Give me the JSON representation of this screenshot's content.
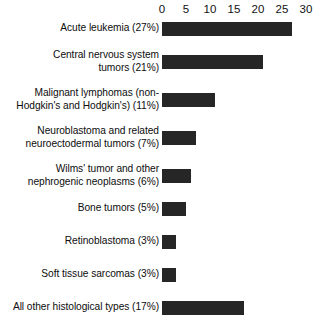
{
  "chart_data": {
    "type": "bar",
    "orientation": "horizontal",
    "title": "",
    "subtitle": "",
    "xlabel": "",
    "ylabel": "",
    "xlim": [
      0,
      30
    ],
    "grid": false,
    "legend": false,
    "bar_color": "#262626",
    "background_color": "#ffffff",
    "axis_position": "top",
    "tick_labels": [
      "0",
      "5",
      "10",
      "15",
      "20",
      "25",
      "30"
    ],
    "ticks": [
      0,
      5,
      10,
      15,
      20,
      25,
      30
    ],
    "categories": [
      "Acute leukemia (27%)",
      "Central nervous system\ntumors (21%)",
      "Malignant lymphomas (non-\nHodgkin's and Hodgkin's) (11%)",
      "Neuroblastoma and related\nneuroectodermal tumors (7%)",
      "Wilms' tumor and other\nnephrogenic neoplasms (6%)",
      "Bone tumors (5%)",
      "Retinoblastoma (3%)",
      "Soft tissue sarcomas (3%)",
      "All other histological types (17%)"
    ],
    "values": [
      27,
      21,
      11,
      7,
      6,
      5,
      3,
      3,
      17
    ]
  }
}
